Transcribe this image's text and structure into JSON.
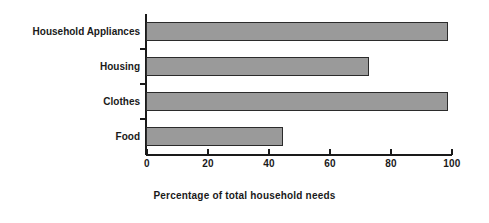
{
  "chart_data": {
    "type": "bar",
    "orientation": "horizontal",
    "title": "",
    "xlabel": "Percentage of total household needs",
    "ylabel": "",
    "categories": [
      "Food",
      "Clothes",
      "Housing",
      "Household Appliances"
    ],
    "values": [
      45,
      99,
      73,
      99
    ],
    "xlim": [
      0,
      100
    ],
    "xticks": [
      0,
      20,
      40,
      60,
      80,
      100
    ],
    "xtick_labels": [
      "0",
      "20",
      "40",
      "60",
      "80",
      "100"
    ],
    "grid": false,
    "legend": false,
    "bar_fill_color": "#9a9a9a",
    "bar_edge_color": "#2b2b2b",
    "axis_color": "#1a1a1a",
    "background_color": "#ffffff"
  },
  "axis": {
    "x_title": "Percentage of total household needs"
  },
  "categories": {
    "household_appliances": "Household Appliances",
    "housing": "Housing",
    "clothes": "Clothes",
    "food": "Food"
  },
  "ticks": {
    "t0": "0",
    "t20": "20",
    "t40": "40",
    "t60": "60",
    "t80": "80",
    "t100": "100"
  }
}
